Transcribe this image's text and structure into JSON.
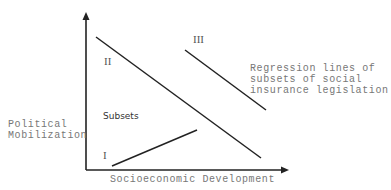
{
  "diagram": {
    "y_axis_label_line1": "Political",
    "y_axis_label_line2": "Mobilization",
    "x_axis_label": "Socioeconomic Development",
    "subsets_label": "Subsets",
    "lines": [
      {
        "label": "I",
        "direction": "ascending"
      },
      {
        "label": "II",
        "direction": "descending"
      },
      {
        "label": "III",
        "direction": "descending"
      }
    ],
    "annotation_line1": "Regression lines of",
    "annotation_line2": "subsets of social",
    "annotation_line3": "insurance legislation",
    "colors": {
      "axis": "#222222",
      "lines": "#222222",
      "text": "#777777"
    }
  }
}
